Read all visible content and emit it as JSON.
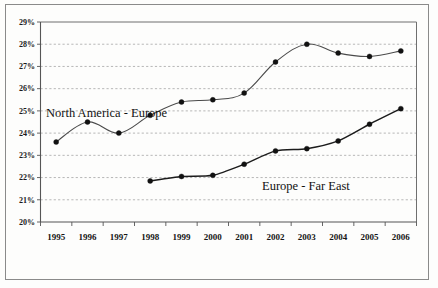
{
  "chart_data": {
    "type": "line",
    "title": "",
    "subtitle": "",
    "xlabel": "",
    "ylabel": "",
    "x": [
      1995,
      1996,
      1997,
      1998,
      1999,
      2000,
      2001,
      2002,
      2003,
      2004,
      2005,
      2006
    ],
    "categories": [
      "1995",
      "1996",
      "1997",
      "1998",
      "1999",
      "2000",
      "2001",
      "2002",
      "2003",
      "2004",
      "2005",
      "2006"
    ],
    "ylim": [
      20,
      29
    ],
    "ytick_values": [
      20,
      21,
      22,
      23,
      24,
      25,
      26,
      27,
      28,
      29
    ],
    "ytick_labels": [
      "20%",
      "21%",
      "22%",
      "23%",
      "24%",
      "25%",
      "26%",
      "27%",
      "28%",
      "29%"
    ],
    "grid": true,
    "grid_axis": "y",
    "legend": "inline-annotations",
    "series": [
      {
        "name": "North America - Europe",
        "label_text": "North America - Europe",
        "color": "#4a4a4a",
        "marker": "circle",
        "values": [
          23.6,
          24.5,
          24.0,
          24.8,
          25.4,
          25.5,
          25.8,
          27.2,
          28.0,
          27.6,
          27.45,
          27.7
        ]
      },
      {
        "name": "Europe - Far East",
        "label_text": "Europe - Far East",
        "color": "#1c1c1c",
        "marker": "circle",
        "values": [
          null,
          null,
          null,
          21.85,
          22.05,
          22.1,
          22.6,
          23.2,
          23.3,
          23.65,
          24.4,
          25.1
        ]
      }
    ],
    "annotations": [
      {
        "text": "North America - Europe",
        "x_px": 46,
        "y_px": 117
      },
      {
        "text": "Europe - Far East",
        "x_px": 262,
        "y_px": 190
      }
    ]
  },
  "figure": {
    "background_color": "#ffffff",
    "frame_color": "#8a8a8a",
    "plot_border_color": "#6f6f6f",
    "gridline_color": "#9a9a9a"
  }
}
